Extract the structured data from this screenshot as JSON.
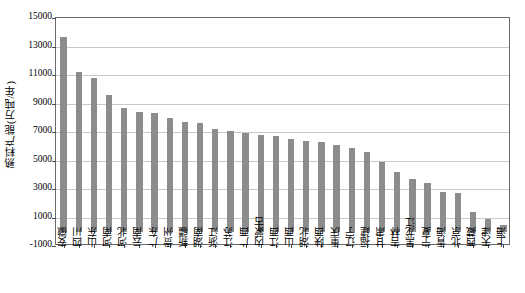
{
  "chart_data": {
    "type": "bar",
    "title": "",
    "xlabel": "",
    "ylabel": "熟料产能(万吨/年)",
    "ylim": [
      -1000,
      15000
    ],
    "ytick_values": [
      -1000,
      1000,
      3000,
      5000,
      7000,
      9000,
      11000,
      13000,
      15000
    ],
    "ytick_labels": [
      "-1000",
      "1000",
      "3000",
      "5000",
      "7000",
      "9000",
      "11000",
      "13000",
      "15000"
    ],
    "grid": true,
    "legend": "none",
    "bar_color": "#8c8c8c",
    "categories": [
      "安徽",
      "四川",
      "山东",
      "河南",
      "河北",
      "云南",
      "广东",
      "贵州",
      "新疆",
      "湖南",
      "浙江",
      "江苏",
      "广西",
      "内蒙古",
      "江西",
      "山西",
      "湖北",
      "陕西",
      "重庆",
      "辽宁",
      "福建",
      "甘肃",
      "吉林",
      "黑龙江",
      "宁夏",
      "青海",
      "北京",
      "西藏",
      "天津",
      "上海"
    ],
    "values": [
      13700,
      11200,
      10800,
      9600,
      8700,
      8400,
      8300,
      8000,
      7700,
      7600,
      7200,
      7100,
      6900,
      6800,
      6700,
      6500,
      6400,
      6300,
      6100,
      5900,
      5600,
      4900,
      4200,
      3700,
      3400,
      2800,
      2700,
      1400,
      900,
      450
    ]
  },
  "axes": {
    "y_title": "熟料产能(万吨/年)"
  }
}
